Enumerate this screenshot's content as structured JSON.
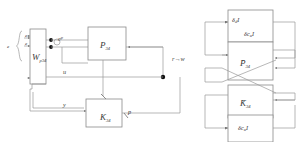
{
  "diagram": {
    "colors": {
      "block_stroke": "#8a8a8a",
      "wire": "#9a9a9a",
      "text": "#3a3a3a",
      "node_dot": "#111111",
      "background": "#ffffff"
    },
    "left_section": {
      "blocks": [
        {
          "id": "wp34",
          "main": "W",
          "sub": "p34",
          "label": "W p34"
        },
        {
          "id": "p34",
          "main": "P",
          "sub": "34",
          "label": "P 34"
        },
        {
          "id": "k34",
          "main": "K",
          "sub": "34",
          "label": "K 34"
        }
      ],
      "signals": [
        {
          "id": "ep",
          "main": "e",
          "sup": "p",
          "label": "e p"
        },
        {
          "id": "u",
          "main": "u",
          "label": "u"
        },
        {
          "id": "y",
          "main": "y",
          "label": "y"
        },
        {
          "id": "p",
          "main": "p",
          "label": "p"
        },
        {
          "id": "rw",
          "label": "r→w"
        }
      ],
      "brace_labels": [
        "e",
        "e"
      ]
    },
    "right_section": {
      "blocks": [
        {
          "id": "delta-d-top",
          "main": "δ",
          "sub": "d",
          "tail": "I",
          "label": "δd I"
        },
        {
          "id": "delta-cu-top",
          "main": "δc",
          "sub": "u",
          "tail": "I",
          "label": "δcu I"
        },
        {
          "id": "pbar34",
          "main": "P̄",
          "sub": "34",
          "label": "P̄ 34"
        },
        {
          "id": "kbar34",
          "main": "K̄",
          "sub": "34",
          "label": "K̄ 34"
        },
        {
          "id": "delta-cu-bottom",
          "main": "δc",
          "sub": "u",
          "tail": "I",
          "label": "δcu I"
        }
      ]
    }
  }
}
